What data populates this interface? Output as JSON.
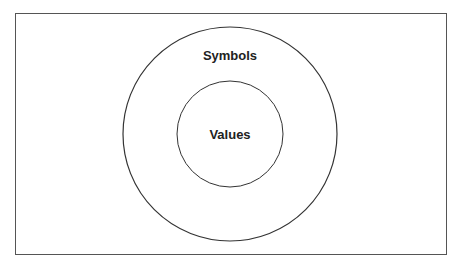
{
  "diagram": {
    "type": "nested-circles",
    "outer": {
      "label": "Symbols",
      "cx": 230,
      "cy": 134,
      "r": 107
    },
    "inner": {
      "label": "Values",
      "cx": 230,
      "cy": 134,
      "r": 53
    },
    "stroke_color": "#333333",
    "frame_color": "#555555"
  }
}
